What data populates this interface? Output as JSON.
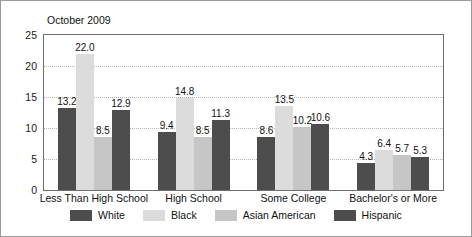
{
  "chart_data": {
    "type": "bar",
    "title": "October 2009",
    "xlabel": "",
    "ylabel": "",
    "ylim": [
      0,
      25
    ],
    "yticks": [
      0,
      5,
      10,
      15,
      20,
      25
    ],
    "grid": true,
    "legend_position": "bottom",
    "categories": [
      "Less Than High School",
      "High School",
      "Some College",
      "Bachelor's or More"
    ],
    "series": [
      {
        "name": "White",
        "color": "#4d4d4d",
        "values": [
          13.2,
          9.4,
          8.6,
          4.3
        ]
      },
      {
        "name": "Black",
        "color": "#dcdcdc",
        "values": [
          22.0,
          14.8,
          13.5,
          6.4
        ]
      },
      {
        "name": "Asian American",
        "color": "#c6c6c6",
        "values": [
          8.5,
          8.5,
          10.2,
          5.7
        ]
      },
      {
        "name": "Hispanic",
        "color": "#4d4d4d",
        "values": [
          12.9,
          11.3,
          10.6,
          5.3
        ]
      }
    ],
    "value_labels": [
      [
        "13.2",
        "22.0",
        "8.5",
        "12.9"
      ],
      [
        "9.4",
        "14.8",
        "8.5",
        "11.3"
      ],
      [
        "8.6",
        "13.5",
        "10.2",
        "10.6"
      ],
      [
        "4.3",
        "6.4",
        "5.7",
        "5.3"
      ]
    ],
    "ytick_labels": [
      "0",
      "5",
      "10",
      "15",
      "20",
      "25"
    ]
  }
}
